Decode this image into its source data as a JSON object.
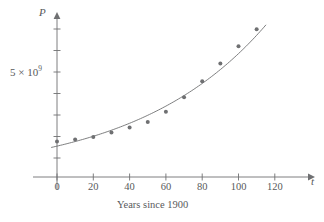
{
  "chart_data": {
    "type": "scatter",
    "title": "",
    "subtitle": "",
    "xlabel": "Years since 1900",
    "ylabel": "P",
    "x_axis_variable": "t",
    "y_axis_variable": "P",
    "xlim": [
      -6,
      130
    ],
    "ylim": [
      0,
      9200000000.0
    ],
    "grid": false,
    "legend": null,
    "x_ticks": [
      0,
      20,
      40,
      60,
      80,
      100,
      120
    ],
    "x_tick_labels": [
      "0",
      "20",
      "40",
      "60",
      "80",
      "100",
      "120"
    ],
    "y_ticks": [
      1000000000.0,
      2000000000.0,
      3000000000.0,
      4000000000.0,
      5000000000.0,
      6000000000.0,
      7000000000.0,
      8000000000.0
    ],
    "y_tick_labels": [
      "",
      "",
      "",
      "",
      "5 × 10⁹",
      "",
      "",
      ""
    ],
    "y_tick_label_main": "5 × 10",
    "y_tick_label_exponent": "9",
    "x": [
      0,
      10,
      20,
      30,
      40,
      50,
      60,
      70,
      80,
      90,
      100,
      110
    ],
    "y": [
      1650000000,
      1750000000,
      1860000000,
      2070000000,
      2300000000,
      2560000000,
      3040000000,
      3710000000,
      4450000000,
      5280000000,
      6080000000,
      6870000000
    ],
    "point_color": "#6f7072",
    "point_size": 2.0,
    "curve": {
      "label": "exponential model",
      "color": "#6f7072",
      "t_start": -3,
      "t_end": 115,
      "a": 1436000000,
      "b": 1.01395
    },
    "axis_color": "#6f7072",
    "text_color": "#58595b",
    "background": "#ffffff"
  },
  "figure": {
    "axis_label_y": "P",
    "axis_label_x": "t",
    "caption": "Years since 1900"
  }
}
